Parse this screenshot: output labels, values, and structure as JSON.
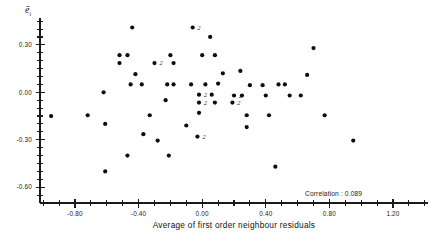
{
  "chart_data": {
    "type": "scatter",
    "title": "",
    "xlabel": "Average of first order neighbour residuals",
    "ylabel": "ẽi",
    "xlim": [
      -1.02,
      1.42
    ],
    "ylim": [
      -0.7,
      0.47
    ],
    "grid": false,
    "legend_position": "none",
    "xticks": [
      -0.8,
      -0.4,
      0.0,
      0.4,
      0.8,
      1.2
    ],
    "xtick_labels": [
      "-0.80",
      "-0.40",
      "0.00",
      "0.40",
      "0.80",
      "1.20"
    ],
    "yticks": [
      0.3,
      0.0,
      -0.3,
      -0.6
    ],
    "ytick_labels": [
      "0.30",
      "0.00",
      "-0.30",
      "-0.60"
    ],
    "x_minor_step": 0.1,
    "y_minor_step": 0.05,
    "annotations": [
      {
        "text": "Correlation : 0.089",
        "x": 0.58,
        "y": -0.49
      }
    ],
    "overlap_marker_label": "2",
    "points": [
      {
        "x": -0.44,
        "y": 0.41,
        "n": 1
      },
      {
        "x": -0.06,
        "y": 0.41,
        "n": 2
      },
      {
        "x": 0.05,
        "y": 0.35,
        "n": 1
      },
      {
        "x": -0.52,
        "y": 0.235,
        "n": 1
      },
      {
        "x": -0.47,
        "y": 0.235,
        "n": 1
      },
      {
        "x": -0.2,
        "y": 0.235,
        "n": 1
      },
      {
        "x": 0.0,
        "y": 0.235,
        "n": 1
      },
      {
        "x": 0.08,
        "y": 0.235,
        "n": 1
      },
      {
        "x": -0.52,
        "y": 0.185,
        "n": 1
      },
      {
        "x": -0.3,
        "y": 0.185,
        "n": 2
      },
      {
        "x": -0.18,
        "y": 0.185,
        "n": 1
      },
      {
        "x": -0.42,
        "y": 0.115,
        "n": 1
      },
      {
        "x": 0.13,
        "y": 0.12,
        "n": 1
      },
      {
        "x": -0.45,
        "y": 0.05,
        "n": 1
      },
      {
        "x": -0.38,
        "y": 0.05,
        "n": 1
      },
      {
        "x": -0.22,
        "y": 0.05,
        "n": 1
      },
      {
        "x": -0.18,
        "y": 0.05,
        "n": 1
      },
      {
        "x": -0.07,
        "y": 0.05,
        "n": 1
      },
      {
        "x": 0.02,
        "y": 0.05,
        "n": 1
      },
      {
        "x": 0.1,
        "y": 0.055,
        "n": 1
      },
      {
        "x": -0.62,
        "y": 0.0,
        "n": 1
      },
      {
        "x": 0.3,
        "y": 0.045,
        "n": 1
      },
      {
        "x": 0.38,
        "y": 0.045,
        "n": 1
      },
      {
        "x": 0.48,
        "y": 0.05,
        "n": 1
      },
      {
        "x": 0.52,
        "y": 0.05,
        "n": 1
      },
      {
        "x": 0.24,
        "y": 0.135,
        "n": 1
      },
      {
        "x": 0.66,
        "y": 0.11,
        "n": 1
      },
      {
        "x": 0.7,
        "y": 0.28,
        "n": 1
      },
      {
        "x": -0.23,
        "y": -0.05,
        "n": 1
      },
      {
        "x": -0.02,
        "y": -0.015,
        "n": 2
      },
      {
        "x": 0.06,
        "y": -0.015,
        "n": 1
      },
      {
        "x": 0.2,
        "y": -0.02,
        "n": 2
      },
      {
        "x": 0.25,
        "y": -0.02,
        "n": 1
      },
      {
        "x": 0.4,
        "y": -0.02,
        "n": 1
      },
      {
        "x": 0.55,
        "y": -0.02,
        "n": 1
      },
      {
        "x": 0.62,
        "y": -0.02,
        "n": 1
      },
      {
        "x": -0.02,
        "y": -0.065,
        "n": 2
      },
      {
        "x": 0.08,
        "y": -0.065,
        "n": 1
      },
      {
        "x": 0.19,
        "y": -0.065,
        "n": 2
      },
      {
        "x": -0.95,
        "y": -0.15,
        "n": 1
      },
      {
        "x": -0.72,
        "y": -0.145,
        "n": 1
      },
      {
        "x": -0.33,
        "y": -0.145,
        "n": 1
      },
      {
        "x": -0.02,
        "y": -0.13,
        "n": 1
      },
      {
        "x": 0.28,
        "y": -0.145,
        "n": 1
      },
      {
        "x": 0.42,
        "y": -0.145,
        "n": 1
      },
      {
        "x": 0.77,
        "y": -0.145,
        "n": 1
      },
      {
        "x": -0.61,
        "y": -0.2,
        "n": 1
      },
      {
        "x": -0.1,
        "y": -0.21,
        "n": 1
      },
      {
        "x": 0.28,
        "y": -0.22,
        "n": 1
      },
      {
        "x": -0.37,
        "y": -0.265,
        "n": 1
      },
      {
        "x": -0.03,
        "y": -0.28,
        "n": 2
      },
      {
        "x": -0.28,
        "y": -0.305,
        "n": 1
      },
      {
        "x": 0.95,
        "y": -0.305,
        "n": 1
      },
      {
        "x": -0.47,
        "y": -0.4,
        "n": 1
      },
      {
        "x": -0.21,
        "y": -0.4,
        "n": 1
      },
      {
        "x": -0.61,
        "y": -0.5,
        "n": 1
      },
      {
        "x": 0.46,
        "y": -0.47,
        "n": 1
      }
    ]
  }
}
